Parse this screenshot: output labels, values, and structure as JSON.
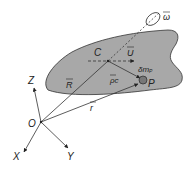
{
  "diagram": {
    "colors": {
      "body_fill": "#a8a8a8",
      "body_stroke": "#333333",
      "line": "#333333",
      "background": "#ffffff"
    },
    "axes": {
      "origin": "O",
      "x": "X",
      "y": "Y",
      "z": "Z"
    },
    "points": {
      "center": "C",
      "particle": "P"
    },
    "vectors": {
      "R": "R",
      "r": "r",
      "rho": "ρc",
      "U": "U",
      "omega": "ω"
    },
    "mass_element": "δm",
    "mass_subscript": "P"
  }
}
